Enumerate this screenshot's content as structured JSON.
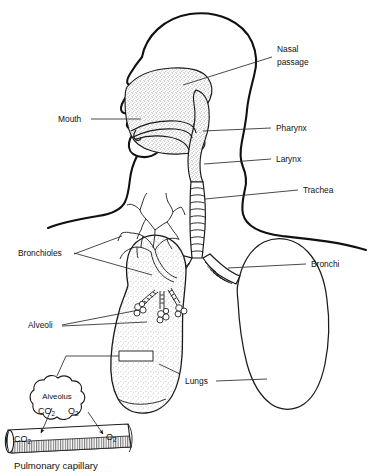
{
  "figure": {
    "background_color": "#ffffff",
    "line_color": "#111111",
    "stipple_color": "#555555"
  },
  "labels": {
    "nasal_passage_line1": "Nasal",
    "nasal_passage_line2": "passage",
    "mouth": "Mouth",
    "pharynx": "Pharynx",
    "larynx": "Larynx",
    "trachea": "Trachea",
    "bronchioles": "Bronchioles",
    "bronchi": "Bronchi",
    "alveoli": "Alveoli",
    "lungs": "Lungs",
    "alveolus": "Alveolus",
    "pulmonary_capillary": "Pulmonary capillary"
  },
  "gas_labels": {
    "alveolus_co2": "CO",
    "alveolus_co2_sub": "2",
    "alveolus_o2": "O",
    "alveolus_o2_sub": "2",
    "capillary_co2": "CO",
    "capillary_co2_sub": "2",
    "capillary_o2": "O",
    "capillary_o2_sub": "2"
  },
  "structures": [
    {
      "name": "head-profile",
      "shaded": false
    },
    {
      "name": "nasal-cavity",
      "shaded": true
    },
    {
      "name": "hard-palate",
      "shaded": false
    },
    {
      "name": "tongue",
      "shaded": false
    },
    {
      "name": "pharynx",
      "shaded": true
    },
    {
      "name": "larynx",
      "shaded": true
    },
    {
      "name": "trachea",
      "shaded": false
    },
    {
      "name": "left-lung",
      "shaded": true
    },
    {
      "name": "right-lung",
      "shaded": false
    },
    {
      "name": "bronchial-tree",
      "shaded": false
    },
    {
      "name": "alveolar-clusters",
      "shaded": false
    },
    {
      "name": "alveolus-detail",
      "shaded": false
    },
    {
      "name": "pulmonary-capillary",
      "shaded": false
    }
  ]
}
